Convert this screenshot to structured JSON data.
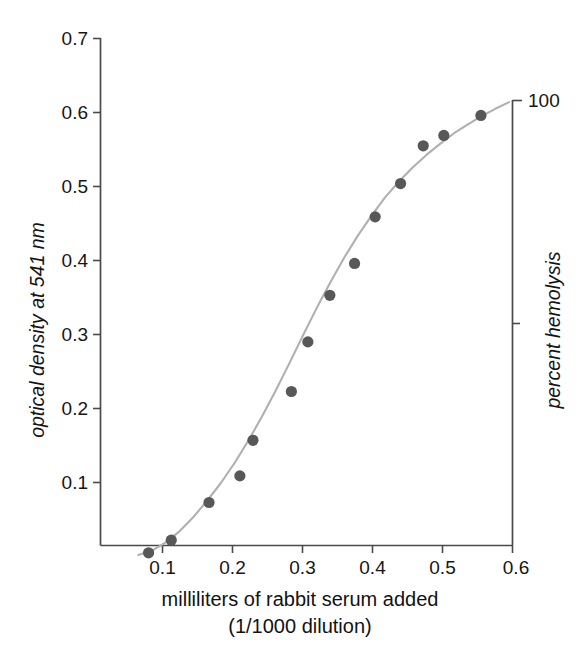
{
  "chart_data": {
    "type": "scatter",
    "title": "",
    "xlabel": "milliliters of rabbit serum added",
    "xlabel_line2": "(1/1000 dilution)",
    "ylabel": "optical density at 541 nm",
    "y2label": "percent hemolysis",
    "xlim": [
      0.0,
      0.6
    ],
    "ylim": [
      0.0,
      0.7
    ],
    "y2lim": [
      0,
      100
    ],
    "grid": false,
    "legend": null,
    "xticks": [
      "0.1",
      "0.2",
      "0.3",
      "0.4",
      "0.5",
      "0.6"
    ],
    "xtick_values": [
      0.1,
      0.2,
      0.3,
      0.4,
      0.5,
      0.6
    ],
    "yticks": [
      "0.1",
      "0.2",
      "0.3",
      "0.4",
      "0.5",
      "0.6",
      "0.7"
    ],
    "ytick_values": [
      0.1,
      0.2,
      0.3,
      0.4,
      0.5,
      0.6,
      0.7
    ],
    "y2ticks": [
      "100"
    ],
    "y2tick_values": [
      100
    ],
    "series": [
      {
        "name": "hemolysis titration",
        "marker": "filled-circle",
        "marker_color": "#585858",
        "x": [
          0.07,
          0.103,
          0.158,
          0.203,
          0.222,
          0.278,
          0.302,
          0.334,
          0.37,
          0.4,
          0.437,
          0.47,
          0.5,
          0.554
        ],
        "y": [
          0.005,
          0.022,
          0.073,
          0.109,
          0.157,
          0.223,
          0.29,
          0.353,
          0.396,
          0.459,
          0.504,
          0.555,
          0.569,
          0.596
        ]
      }
    ],
    "fit_curve": {
      "name": "sigmoid fit",
      "color": "#b0b0b0",
      "x": [
        0.055,
        0.075,
        0.095,
        0.115,
        0.135,
        0.155,
        0.175,
        0.195,
        0.215,
        0.235,
        0.255,
        0.275,
        0.295,
        0.315,
        0.335,
        0.355,
        0.375,
        0.395,
        0.415,
        0.435,
        0.455,
        0.475,
        0.495,
        0.515,
        0.535,
        0.555,
        0.575,
        0.595
      ],
      "y": [
        0.002,
        0.008,
        0.019,
        0.034,
        0.053,
        0.075,
        0.099,
        0.126,
        0.156,
        0.189,
        0.224,
        0.261,
        0.299,
        0.336,
        0.371,
        0.404,
        0.434,
        0.461,
        0.486,
        0.507,
        0.526,
        0.543,
        0.558,
        0.572,
        0.584,
        0.595,
        0.605,
        0.614
      ]
    }
  },
  "axes": {
    "y_left_title": "optical density at 541 nm",
    "y_right_title": "percent hemolysis",
    "x_title_line1": "milliliters of rabbit serum added",
    "x_title_line2": "(1/1000 dilution)",
    "y_right_top_label": "100"
  },
  "colors": {
    "marker": "#585858",
    "curve": "#b0b0b0",
    "axis": "#4a4a4a",
    "text": "#161616",
    "background": "#ffffff"
  }
}
